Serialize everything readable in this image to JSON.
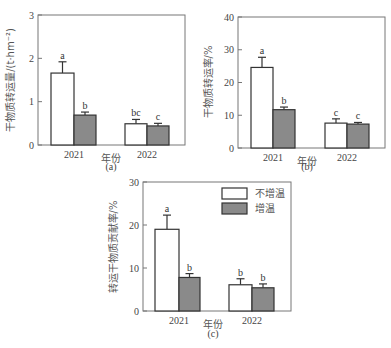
{
  "chart_data": [
    {
      "type": "bar",
      "panel": "(a)",
      "ylabel": "干物质转运量/(t·hm⁻²)",
      "xlabel": "年份",
      "categories": [
        "2021",
        "2022"
      ],
      "ylim": [
        0,
        3
      ],
      "yticks": [
        "0",
        "1",
        "2",
        "3"
      ],
      "series": [
        {
          "name": "不增温",
          "values": [
            1.66,
            0.49
          ],
          "errors": [
            0.26,
            0.1
          ],
          "letters": [
            "a",
            "bc"
          ],
          "color": "#ffffff"
        },
        {
          "name": "增温",
          "values": [
            0.69,
            0.44
          ],
          "errors": [
            0.07,
            0.06
          ],
          "letters": [
            "b",
            "c"
          ],
          "color": "#8a8a8a"
        }
      ]
    },
    {
      "type": "bar",
      "panel": "(b)",
      "ylabel": "干物质转运率/%",
      "xlabel": "年份",
      "categories": [
        "2021",
        "2022"
      ],
      "ylim": [
        0,
        40
      ],
      "yticks": [
        "0",
        "10",
        "20",
        "30",
        "40"
      ],
      "series": [
        {
          "name": "不增温",
          "values": [
            24.6,
            7.6
          ],
          "errors": [
            3.1,
            1.3
          ],
          "letters": [
            "a",
            "c"
          ],
          "color": "#ffffff"
        },
        {
          "name": "增温",
          "values": [
            11.7,
            7.3
          ],
          "errors": [
            0.8,
            0.5
          ],
          "letters": [
            "b",
            "c"
          ],
          "color": "#8a8a8a"
        }
      ]
    },
    {
      "type": "bar",
      "panel": "(c)",
      "ylabel": "转运干物质贡献率/%",
      "xlabel": "年份",
      "categories": [
        "2021",
        "2022"
      ],
      "ylim": [
        0,
        30
      ],
      "yticks": [
        "0",
        "10",
        "20",
        "30"
      ],
      "legend": [
        "不增温",
        "增温"
      ],
      "series": [
        {
          "name": "不增温",
          "values": [
            19.0,
            6.1
          ],
          "errors": [
            3.3,
            1.4
          ],
          "letters": [
            "a",
            "b"
          ],
          "color": "#ffffff"
        },
        {
          "name": "增温",
          "values": [
            7.8,
            5.4
          ],
          "errors": [
            0.9,
            0.9
          ],
          "letters": [
            "b",
            "b"
          ],
          "color": "#8a8a8a"
        }
      ]
    }
  ]
}
